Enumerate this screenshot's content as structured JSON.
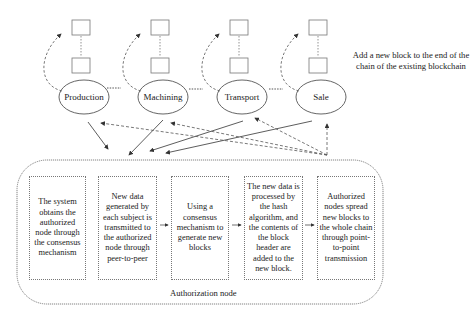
{
  "diagram": {
    "stages": [
      {
        "id": "production",
        "label": "Production"
      },
      {
        "id": "machining",
        "label": "Machining"
      },
      {
        "id": "transport",
        "label": "Transport"
      },
      {
        "id": "sale",
        "label": "Sale"
      }
    ],
    "note": "Add a new block to the end of the chain of the existing blockchain",
    "note_lines": [
      "Add a new block to the end of the",
      "chain of the existing blockchain"
    ],
    "authorization_node": {
      "label": "Authorization node",
      "steps": [
        {
          "text": "The system obtains the authorized node through the consensus mechanism"
        },
        {
          "text": "New data generated by each subject is transmitted to the authorized node through peer-to-peer"
        },
        {
          "text": "Using a consensus mechanism to generate new blocks"
        },
        {
          "text": "The new data is processed by the hash algorithm, and the contents of the block header are added to the new block."
        },
        {
          "text": "Authorized nodes spread new blocks to the whole chain through point-to-point transmission"
        }
      ]
    },
    "colors": {
      "line": "#333333",
      "dashed": "#555555",
      "box_border": "#777777"
    }
  }
}
